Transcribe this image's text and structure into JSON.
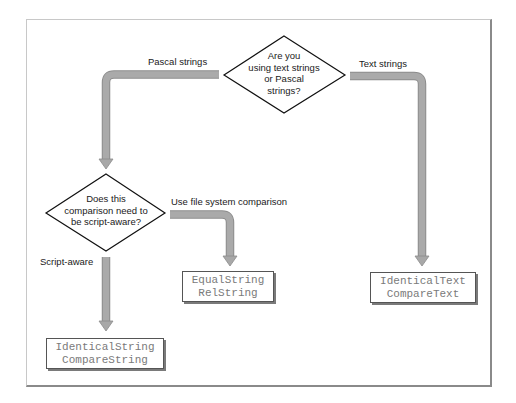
{
  "diagram": {
    "type": "flowchart",
    "decisions": [
      {
        "id": "text-or-pascal",
        "text": "Are you\nusing text strings\nor Pascal\nstrings?"
      },
      {
        "id": "script-aware",
        "text": "Does this\ncomparison need to\nbe script-aware?"
      }
    ],
    "edges": [
      {
        "from": "text-or-pascal",
        "to": "script-aware",
        "label": "Pascal strings"
      },
      {
        "from": "text-or-pascal",
        "to": "text-routines",
        "label": "Text strings"
      },
      {
        "from": "script-aware",
        "to": "file-system-routines",
        "label": "Use file system comparison"
      },
      {
        "from": "script-aware",
        "to": "script-aware-routines",
        "label": "Script-aware"
      }
    ],
    "results": [
      {
        "id": "file-system-routines",
        "lines": [
          "EqualString",
          "RelString"
        ]
      },
      {
        "id": "text-routines",
        "lines": [
          "IdenticalText",
          "CompareText"
        ]
      },
      {
        "id": "script-aware-routines",
        "lines": [
          "IdenticalString",
          "CompareString"
        ]
      }
    ],
    "colors": {
      "arrow_fill": "#a8a8a8",
      "arrow_edge": "#8c8c8c",
      "diamond_stroke": "#111111",
      "box_border": "#555555",
      "code_text": "#7a7a7a"
    }
  }
}
